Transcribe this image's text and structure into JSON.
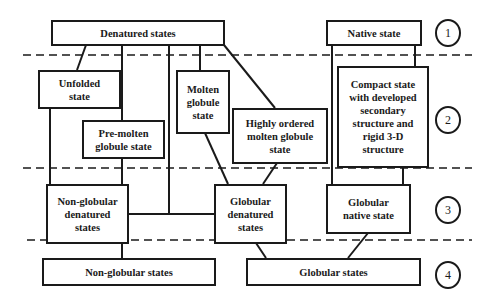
{
  "diagram": {
    "type": "protein folding state hierarchy",
    "levels": [
      {
        "number": "1",
        "nodes": [
          {
            "id": "denatured",
            "label": "Denatured states"
          },
          {
            "id": "native",
            "label": "Native state"
          }
        ]
      },
      {
        "number": "2",
        "nodes": [
          {
            "id": "unfolded",
            "label": "Unfolded state"
          },
          {
            "id": "premolten",
            "label": "Pre-molten globule state"
          },
          {
            "id": "molten",
            "label": "Molten globule state"
          },
          {
            "id": "highly_ordered",
            "label": "Highly ordered molten globule state"
          },
          {
            "id": "compact",
            "label": "Compact state with developed secondary structure and rigid 3-D structure"
          }
        ]
      },
      {
        "number": "3",
        "nodes": [
          {
            "id": "nonglob_denatured",
            "label": "Non-globular denatured states"
          },
          {
            "id": "glob_denatured",
            "label": "Globular denatured states"
          },
          {
            "id": "glob_native",
            "label": "Globular native state"
          }
        ]
      },
      {
        "number": "4",
        "nodes": [
          {
            "id": "nonglob_states",
            "label": "Non-globular states"
          },
          {
            "id": "glob_states",
            "label": "Globular states"
          }
        ]
      }
    ],
    "edges": [
      [
        "denatured",
        "unfolded"
      ],
      [
        "denatured",
        "premolten"
      ],
      [
        "denatured",
        "molten"
      ],
      [
        "denatured",
        "highly_ordered"
      ],
      [
        "denatured",
        "glob_denatured"
      ],
      [
        "native",
        "compact"
      ],
      [
        "native",
        "glob_native"
      ],
      [
        "unfolded",
        "nonglob_denatured"
      ],
      [
        "premolten",
        "nonglob_denatured"
      ],
      [
        "molten",
        "glob_denatured"
      ],
      [
        "highly_ordered",
        "glob_denatured"
      ],
      [
        "compact",
        "glob_native"
      ],
      [
        "nonglob_denatured",
        "nonglob_states"
      ],
      [
        "glob_denatured",
        "glob_states"
      ],
      [
        "glob_native",
        "glob_states"
      ]
    ]
  },
  "labels": {
    "denatured": "Denatured states",
    "native": "Native state",
    "unfolded": "Unfolded state",
    "premolten": "Pre-molten globule state",
    "molten": "Molten globule state",
    "highly_ordered": "Highly ordered molten globule state",
    "compact": "Compact state with developed secondary structure and rigid 3-D structure",
    "nonglob_denatured": "Non-globular denatured states",
    "glob_denatured": "Globular denatured states",
    "glob_native": "Globular native state",
    "nonglob_states": "Non-globular states",
    "glob_states": "Globular states"
  },
  "level_markers": [
    "1",
    "2",
    "3",
    "4"
  ],
  "colors": {
    "line": "#1a1a1a",
    "background": "#ffffff"
  }
}
